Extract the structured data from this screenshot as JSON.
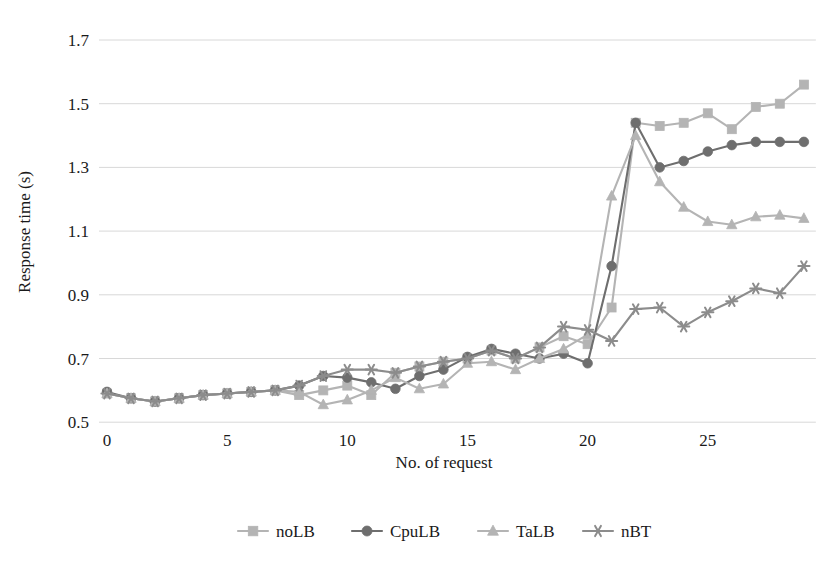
{
  "chart_data": {
    "type": "line",
    "title": "",
    "xlabel": "No. of request",
    "ylabel": "Response time (s)",
    "xlim": [
      0,
      29
    ],
    "ylim": [
      0.5,
      1.7
    ],
    "ytick_labels": [
      "1.7",
      "1.5",
      "1.3",
      "1.1",
      "0.9",
      "0.7",
      "0.5"
    ],
    "ytick_values": [
      1.7,
      1.5,
      1.3,
      1.1,
      0.9,
      0.7,
      0.5
    ],
    "xtick_labels": [
      "0",
      "5",
      "10",
      "15",
      "20",
      "25"
    ],
    "xtick_values": [
      0,
      5,
      10,
      15,
      20,
      25
    ],
    "grid": "horizontal",
    "legend_position": "bottom",
    "x": [
      0,
      1,
      2,
      3,
      4,
      5,
      6,
      7,
      8,
      9,
      10,
      11,
      12,
      13,
      14,
      15,
      16,
      17,
      18,
      19,
      20,
      21,
      22,
      23,
      24,
      25,
      26,
      27,
      28,
      29
    ],
    "series": [
      {
        "name": "noLB",
        "marker": "square",
        "color": "#b4b4b4",
        "values": [
          0.59,
          0.575,
          0.565,
          0.575,
          0.585,
          0.59,
          0.595,
          0.6,
          0.585,
          0.6,
          0.615,
          0.585,
          0.655,
          0.675,
          0.69,
          0.7,
          0.725,
          0.7,
          0.735,
          0.77,
          0.745,
          0.86,
          1.44,
          1.43,
          1.44,
          1.47,
          1.42,
          1.49,
          1.5,
          1.56
        ]
      },
      {
        "name": "CpuLB",
        "marker": "circle",
        "color": "#6e6e6e",
        "values": [
          0.595,
          0.575,
          0.565,
          0.575,
          0.585,
          0.59,
          0.595,
          0.6,
          0.615,
          0.645,
          0.64,
          0.625,
          0.605,
          0.645,
          0.665,
          0.705,
          0.73,
          0.715,
          0.7,
          0.715,
          0.685,
          0.99,
          1.44,
          1.3,
          1.32,
          1.35,
          1.37,
          1.38,
          1.38,
          1.38
        ]
      },
      {
        "name": "TaLB",
        "marker": "triangle",
        "color": "#b4b4b4",
        "values": [
          0.59,
          0.575,
          0.565,
          0.575,
          0.585,
          0.59,
          0.595,
          0.6,
          0.595,
          0.555,
          0.57,
          0.6,
          0.64,
          0.605,
          0.62,
          0.685,
          0.69,
          0.665,
          0.7,
          0.73,
          0.775,
          1.21,
          1.4,
          1.255,
          1.175,
          1.13,
          1.12,
          1.145,
          1.15,
          1.14
        ]
      },
      {
        "name": "nBT",
        "marker": "asterisk",
        "color": "#8c8c8c",
        "values": [
          0.59,
          0.575,
          0.565,
          0.575,
          0.585,
          0.59,
          0.595,
          0.6,
          0.615,
          0.645,
          0.665,
          0.665,
          0.655,
          0.675,
          0.69,
          0.7,
          0.725,
          0.7,
          0.735,
          0.8,
          0.79,
          0.755,
          0.855,
          0.86,
          0.8,
          0.845,
          0.88,
          0.92,
          0.905,
          0.99
        ]
      }
    ]
  },
  "legend": {
    "items": [
      {
        "label": "noLB"
      },
      {
        "label": "CpuLB"
      },
      {
        "label": "TaLB"
      },
      {
        "label": "nBT"
      }
    ]
  }
}
